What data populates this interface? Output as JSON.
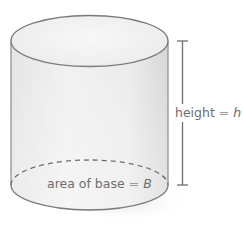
{
  "figure": {
    "type": "cylinder",
    "labels": {
      "height": {
        "text": "height",
        "equals": "=",
        "variable": "h"
      },
      "base": {
        "text": "area of base",
        "equals": "=",
        "variable": "B"
      }
    },
    "colors": {
      "outline": "#7a7a7a",
      "body_light": "#f4f4f4",
      "body_dark": "#d9d9d9",
      "top_face": "#f2f2f2",
      "dashed_edge": "#6e6e6e",
      "dimension_line": "#6e6e6e",
      "label_text": "#6e6e6e"
    }
  }
}
